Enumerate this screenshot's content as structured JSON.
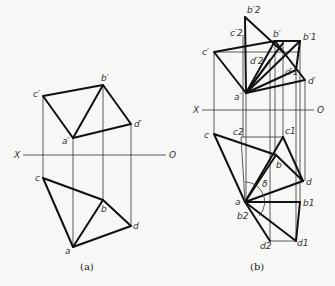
{
  "figure_a": {
    "caption": "(a)",
    "axis": {
      "x_label": "X",
      "o_label": "O"
    },
    "front_view_labels": {
      "a": "a′",
      "b": "b′",
      "c": "c′",
      "d": "d′"
    },
    "top_view_labels": {
      "a": "a",
      "b": "b",
      "c": "c",
      "d": "d"
    }
  },
  "figure_b": {
    "caption": "(b)",
    "axis": {
      "x_label": "X",
      "o_label": "O"
    },
    "front_view_labels": {
      "a": "a′",
      "b": "b′",
      "c": "c′",
      "d": "d′",
      "b1": "b′1",
      "c1": "c′1",
      "d1": "d′1",
      "b2": "b′2",
      "c2": "c′2",
      "d2": "d′2"
    },
    "top_view_labels": {
      "a": "a",
      "b": "b",
      "c": "c",
      "d": "d",
      "b1": "b1",
      "c1": "c1",
      "d1": "d1",
      "b2": "b2",
      "c2": "c2",
      "d2": "d2",
      "angle": "δ"
    }
  }
}
